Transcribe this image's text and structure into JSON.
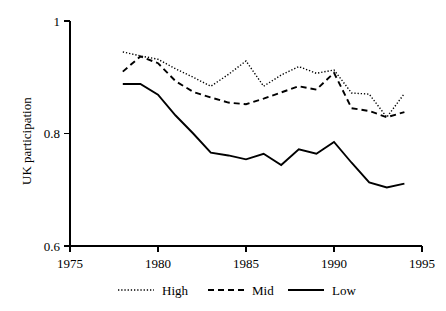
{
  "chart_data": {
    "type": "line",
    "title": "",
    "xlabel": "",
    "ylabel": "UK participation",
    "xlim": [
      1975,
      1995
    ],
    "ylim": [
      0.6,
      1.0
    ],
    "xticks": [
      1975,
      1980,
      1985,
      1990,
      1995
    ],
    "xtick_labels": [
      "1975",
      "1980",
      "1985",
      "1990",
      "1995"
    ],
    "yticks": [
      0.6,
      0.8,
      1.0
    ],
    "ytick_labels": [
      "0.6",
      "0.8",
      "1"
    ],
    "grid": false,
    "legend_position": "bottom",
    "x": [
      1978,
      1979,
      1980,
      1981,
      1982,
      1983,
      1984,
      1985,
      1986,
      1987,
      1988,
      1989,
      1990,
      1991,
      1992,
      1993,
      1994
    ],
    "series": [
      {
        "name": "High",
        "style": "dotted",
        "values": [
          0.945,
          0.938,
          0.932,
          0.915,
          0.9,
          0.884,
          0.905,
          0.929,
          0.884,
          0.904,
          0.919,
          0.907,
          0.913,
          0.872,
          0.87,
          0.829,
          0.871
        ]
      },
      {
        "name": "Mid",
        "style": "dashed",
        "values": [
          0.91,
          0.937,
          0.925,
          0.893,
          0.874,
          0.864,
          0.855,
          0.852,
          0.862,
          0.873,
          0.884,
          0.878,
          0.908,
          0.845,
          0.84,
          0.829,
          0.838
        ]
      },
      {
        "name": "Low",
        "style": "solid",
        "values": [
          0.888,
          0.888,
          0.869,
          0.832,
          0.8,
          0.766,
          0.761,
          0.754,
          0.764,
          0.744,
          0.772,
          0.764,
          0.785,
          0.748,
          0.713,
          0.704,
          0.711
        ]
      }
    ],
    "legend": [
      {
        "label": "High",
        "style": "dotted"
      },
      {
        "label": "Mid",
        "style": "dashed"
      },
      {
        "label": "Low",
        "style": "solid"
      }
    ]
  }
}
